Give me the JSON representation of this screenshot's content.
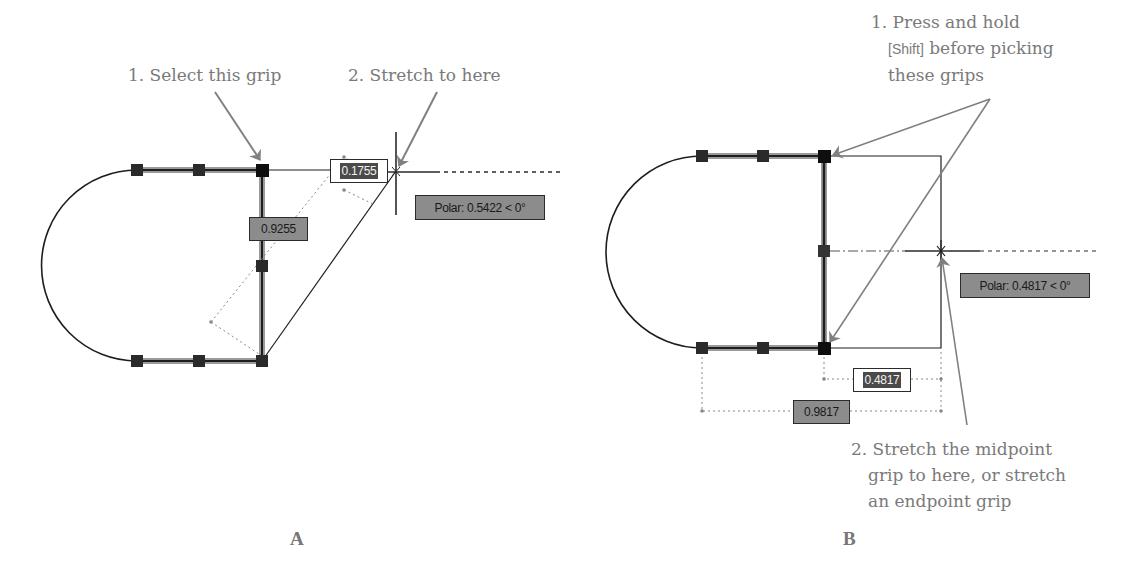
{
  "panel_a": {
    "label": "A",
    "callout_1": "1. Select this grip",
    "callout_2": "2. Stretch to here",
    "input_dimension": "0.1755",
    "static_dimension": "0.9255",
    "polar_tooltip": "Polar: 0.5422 < 0°"
  },
  "panel_b": {
    "label": "B",
    "callout_1": {
      "line1": "1. Press and hold",
      "key": "[Shift]",
      "line2_rest": " before picking",
      "line3": "these grips"
    },
    "callout_2": {
      "line1": "2. Stretch the midpoint",
      "line2": "grip to here, or stretch",
      "line3": "an endpoint grip"
    },
    "input_dimension": "0.4817",
    "static_dimension": "0.9817",
    "polar_tooltip": "Polar: 0.4817 < 0°"
  },
  "colors": {
    "callout_text": "#7a7a7a",
    "arrow": "#808080",
    "geometry": "#1e1e1e",
    "grip": "#2a2a2a",
    "tooltip_bg": "#8c8c8c"
  }
}
